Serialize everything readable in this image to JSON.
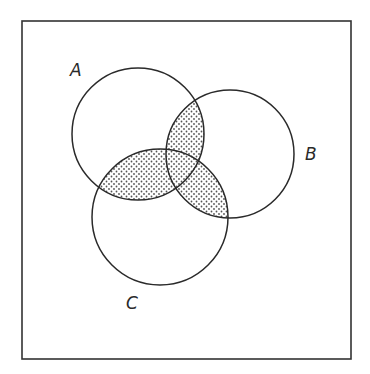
{
  "diagram": {
    "type": "venn",
    "frame": {
      "x": 22,
      "y": 21,
      "width": 329,
      "height": 338,
      "stroke": "#333333"
    },
    "sets": [
      {
        "id": "A",
        "label": "A",
        "cx": 138,
        "cy": 134,
        "r": 66,
        "label_x": 70,
        "label_y": 76
      },
      {
        "id": "B",
        "label": "B",
        "cx": 230,
        "cy": 154,
        "r": 64,
        "label_x": 305,
        "label_y": 160
      },
      {
        "id": "C",
        "label": "C",
        "cx": 160,
        "cy": 217,
        "r": 68,
        "label_x": 126,
        "label_y": 309
      }
    ],
    "shaded_regions": [
      "A∩B",
      "A∩C",
      "B∩C"
    ],
    "shading": {
      "style": "dot-stipple",
      "dot_color": "#555555",
      "background": "#ffffff"
    },
    "stroke_color": "#2a2a2a"
  }
}
